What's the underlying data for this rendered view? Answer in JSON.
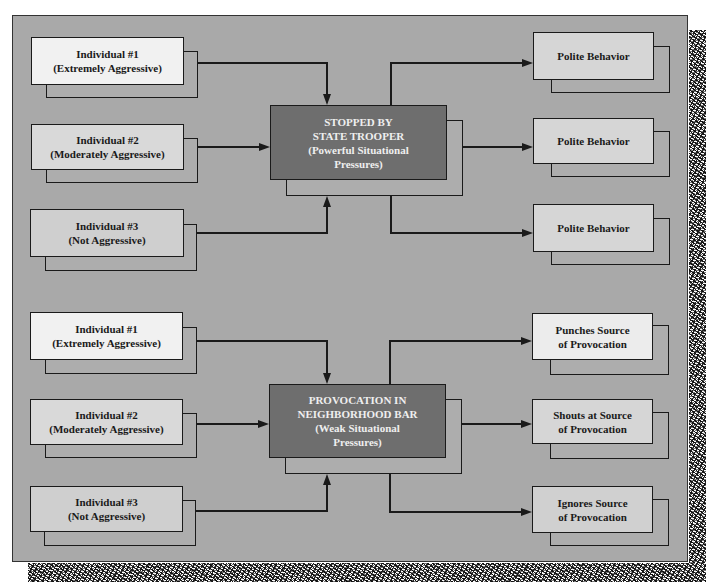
{
  "colors": {
    "frame_background": "#a9a9a9",
    "center_box_fill": "#6e6e6e",
    "center_box_text": "#efefef",
    "individual_1_fill": "#f1f1f1",
    "individual_2_fill": "#d9d9d9",
    "individual_3_fill": "#cfcfcf",
    "outcome_fill": "#d6d6d6",
    "line_color": "#1a1a1a"
  },
  "top_scenario": {
    "inputs": [
      {
        "line1": "Individual #1",
        "line2": "(Extremely Aggressive)"
      },
      {
        "line1": "Individual #2",
        "line2": "(Moderately Aggressive)"
      },
      {
        "line1": "Individual #3",
        "line2": "(Not Aggressive)"
      }
    ],
    "situation": {
      "line1": "STOPPED BY",
      "line2": "STATE TROOPER",
      "line3": "(Powerful Situational",
      "line4": "Pressures)"
    },
    "outcomes": [
      {
        "line1": "Polite Behavior",
        "line2": ""
      },
      {
        "line1": "Polite Behavior",
        "line2": ""
      },
      {
        "line1": "Polite Behavior",
        "line2": ""
      }
    ]
  },
  "bottom_scenario": {
    "inputs": [
      {
        "line1": "Individual #1",
        "line2": "(Extremely Aggressive)"
      },
      {
        "line1": "Individual #2",
        "line2": "(Moderately Aggressive)"
      },
      {
        "line1": "Individual #3",
        "line2": "(Not Aggressive)"
      }
    ],
    "situation": {
      "line1": "PROVOCATION IN",
      "line2": "NEIGHBORHOOD BAR",
      "line3": "(Weak Situational",
      "line4": "Pressures)"
    },
    "outcomes": [
      {
        "line1": "Punches Source",
        "line2": "of Provocation"
      },
      {
        "line1": "Shouts at Source",
        "line2": "of Provocation"
      },
      {
        "line1": "Ignores Source",
        "line2": "of Provocation"
      }
    ]
  }
}
